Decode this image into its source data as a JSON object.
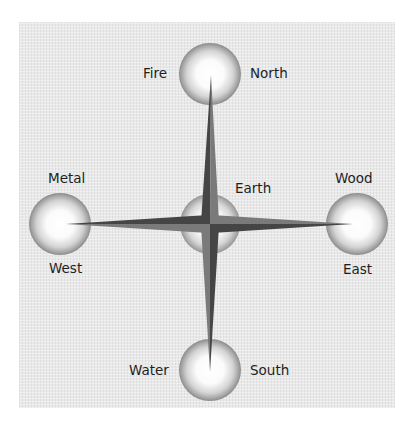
{
  "diagram": {
    "colors": {
      "background": "#e9e9e9",
      "arm_dark": "#454545",
      "arm_light": "#7a7a7a",
      "sphere_rim": "#8a8a8a",
      "text": "#1e1e1e"
    },
    "nodes": [
      {
        "id": "north",
        "element": "Fire",
        "direction": "North"
      },
      {
        "id": "west",
        "element": "Metal",
        "direction": "West"
      },
      {
        "id": "center",
        "element": "Earth",
        "direction": ""
      },
      {
        "id": "east",
        "element": "Wood",
        "direction": "East"
      },
      {
        "id": "south",
        "element": "Water",
        "direction": "South"
      }
    ]
  }
}
